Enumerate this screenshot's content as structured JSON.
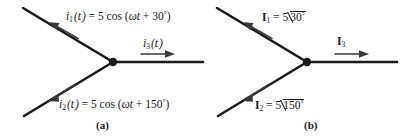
{
  "figure": {
    "width": 416,
    "height": 138,
    "background": "#ffffff",
    "line_color": "#1a1a1a",
    "text_color": "#1a1a1a"
  },
  "panel_a": {
    "caption": "(a)",
    "domain": "time",
    "node": {
      "x": 113,
      "y": 62
    },
    "branches": [
      {
        "name": "branch-i1",
        "label_symbol": "i",
        "label_subscript": "1",
        "label_arg": "(t)",
        "label_equals": "=",
        "label_expression": "5 cos (ωt + 30°)",
        "full_label": "i₁(t) = 5 cos (ωt + 30°)",
        "amplitude": 5,
        "phase_deg": 30,
        "direction": "up-left",
        "arrow_points": "away-from-node"
      },
      {
        "name": "branch-i2",
        "label_symbol": "i",
        "label_subscript": "2",
        "label_arg": "(t)",
        "label_equals": "=",
        "label_expression": "5 cos (ωt + 150°)",
        "full_label": "i₂(t) = 5 cos (ωt + 150°)",
        "amplitude": 5,
        "phase_deg": 150,
        "direction": "down-left",
        "arrow_points": "away-from-node"
      },
      {
        "name": "branch-i3",
        "label_symbol": "i",
        "label_subscript": "3",
        "label_arg": "(t)",
        "full_label": "i₃(t)",
        "direction": "right",
        "arrow_points": "away-from-node"
      }
    ]
  },
  "panel_b": {
    "caption": "(b)",
    "domain": "phasor",
    "node": {
      "x": 99,
      "y": 62
    },
    "branches": [
      {
        "name": "branch-I1",
        "label_symbol": "I",
        "label_subscript": "1",
        "label_equals": "=",
        "magnitude": "5",
        "angle": "30",
        "degree_sign": "°",
        "full_label": "I₁ = 5 ∠21 30°",
        "direction": "up-left",
        "arrow_points": "away-from-node"
      },
      {
        "name": "branch-I2",
        "label_symbol": "I",
        "label_subscript": "2",
        "label_equals": "=",
        "magnitude": "5",
        "angle": "150",
        "degree_sign": "°",
        "full_label": "I₂ = 5 ∠ 150°",
        "direction": "down-left",
        "arrow_points": "away-from-node"
      },
      {
        "name": "branch-I3",
        "label_symbol": "I",
        "label_subscript": "3",
        "full_label": "I₃",
        "direction": "right",
        "arrow_points": "away-from-node"
      }
    ]
  }
}
